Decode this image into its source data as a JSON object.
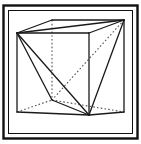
{
  "figure": {
    "name": "cube-with-inscribed-tetrahedron",
    "caption": "",
    "title": "",
    "labels": [],
    "background_color": "#ffffff",
    "line_color": "#1a1a1a",
    "hidden_line_color": "#555555",
    "frame": {
      "outer_color": "#111111",
      "inner_color": "#111111",
      "outer": {
        "x": 3.5,
        "y": 5.5,
        "width": 134,
        "height": 133,
        "stroke_width": 2.4
      },
      "inner": {
        "x": 8.5,
        "y": 10.5,
        "width": 124,
        "height": 123,
        "stroke_width": 1.0
      }
    },
    "projection": "oblique parallel projection",
    "stroke_width_visible": 1.3,
    "stroke_width_hidden": 1.1,
    "hidden_dash": "1.6 2.2",
    "vertices": {
      "front_top_left": {
        "id": "A",
        "x": 17,
        "y": 33
      },
      "front_top_right": {
        "id": "B",
        "x": 89,
        "y": 33
      },
      "front_bottom_left": {
        "id": "C",
        "x": 17,
        "y": 112
      },
      "front_bottom_right": {
        "id": "D",
        "x": 89,
        "y": 115
      },
      "back_top_left": {
        "id": "E",
        "x": 52,
        "y": 20
      },
      "back_top_right": {
        "id": "F",
        "x": 124,
        "y": 20
      },
      "back_bottom_left": {
        "id": "G",
        "x": 52,
        "y": 100
      },
      "back_bottom_right": {
        "id": "H",
        "x": 124,
        "y": 112
      }
    },
    "cube_edges_visible": [
      {
        "name": "top-front",
        "from": "front_top_left",
        "to": "front_top_right"
      },
      {
        "name": "top-back",
        "from": "back_top_left",
        "to": "back_top_right"
      },
      {
        "name": "top-left",
        "from": "front_top_left",
        "to": "back_top_left"
      },
      {
        "name": "top-right",
        "from": "front_top_right",
        "to": "back_top_right"
      },
      {
        "name": "left-vertical",
        "from": "front_top_left",
        "to": "front_bottom_left"
      },
      {
        "name": "center-vertical",
        "from": "front_top_right",
        "to": "front_bottom_right"
      },
      {
        "name": "right-vertical",
        "from": "back_top_right",
        "to": "back_bottom_right"
      },
      {
        "name": "bottom-front",
        "from": "front_bottom_left",
        "to": "front_bottom_right"
      },
      {
        "name": "bottom-right",
        "from": "front_bottom_right",
        "to": "back_bottom_right"
      }
    ],
    "cube_edges_hidden": [
      {
        "name": "back-left-vertical",
        "from": "back_top_left",
        "to": "back_bottom_left"
      },
      {
        "name": "bottom-back-left",
        "from": "front_bottom_left",
        "to": "back_bottom_left"
      },
      {
        "name": "bottom-back-right",
        "from": "back_bottom_left",
        "to": "back_bottom_right"
      }
    ],
    "tetrahedron_edges_visible": [
      {
        "name": "tetra-a",
        "from": "front_top_left",
        "to": "front_bottom_right"
      },
      {
        "name": "tetra-b",
        "from": "front_top_left",
        "to": "back_bottom_left"
      },
      {
        "name": "tetra-c",
        "from": "front_top_left",
        "to": "back_top_right"
      },
      {
        "name": "tetra-d",
        "from": "back_top_right",
        "to": "front_bottom_right"
      },
      {
        "name": "tetra-e",
        "from": "back_bottom_left",
        "to": "front_bottom_right"
      }
    ],
    "tetrahedron_edges_hidden": [
      {
        "name": "tetra-f",
        "from": "back_top_right",
        "to": "back_bottom_left"
      }
    ]
  }
}
